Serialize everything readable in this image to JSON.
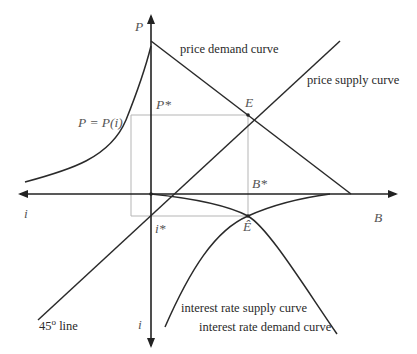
{
  "diagram": {
    "axes": {
      "P": "P",
      "B": "B",
      "i_left": "i",
      "i_down": "i"
    },
    "points": {
      "P_star": "P*",
      "B_star": "B*",
      "i_star": "i*",
      "E": "E",
      "E_hat": "Ê"
    },
    "curves": {
      "price_demand": "price demand curve",
      "price_supply": "price supply curve",
      "interest_supply": "interest rate supply curve",
      "interest_demand": "interest rate demand curve",
      "price_function": "P = P(i)",
      "line45_deg": "45",
      "line45_sup": "o",
      "line45_text": " line"
    },
    "colors": {
      "line": "#2a2a2a",
      "guide": "#b0b0b0"
    }
  }
}
